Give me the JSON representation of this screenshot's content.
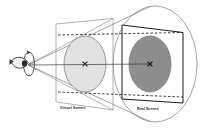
{
  "figure": {
    "type": "diagram",
    "background_color": "#ffffff",
    "line_color": "#555555",
    "bold_line_color": "#1a1a1a",
    "dashed_line_color": "#111111"
  },
  "labels": {
    "virtual_screen": "Virtual Screen",
    "real_screen": "Real Screen"
  },
  "elements": {
    "observer": {
      "name": "eye",
      "outline_color": "#333333",
      "fill_color": "#f2f2f2",
      "pupil_color": "#2b2b2b"
    },
    "rotation_arrow": {
      "name": "rotation-arrow",
      "color": "#4a4a4a"
    },
    "virtual_screen_disc": {
      "fill_color": "#e2e2e2",
      "stroke_color": "#6f6f6f",
      "center_marker": "x"
    },
    "real_screen_disc": {
      "fill_color": "#8e8e8e",
      "stroke_color": "#6f6f6f",
      "center_marker": "x"
    },
    "cone": {
      "stroke_color": "#6f6f6f"
    },
    "virtual_screen_quad": {
      "stroke_color": "#8a8a8a"
    },
    "real_screen_quad": {
      "stroke_color": "#1a1a1a"
    },
    "sight_axis": {
      "stroke_color": "#3a3a3a"
    }
  }
}
